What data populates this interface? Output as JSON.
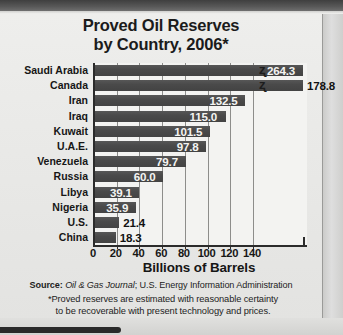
{
  "chart_data": {
    "type": "bar",
    "orientation": "horizontal",
    "title_line1": "Proved Oil Reserves",
    "title_line2": "by Country, 2006*",
    "categories": [
      "Saudi Arabia",
      "Canada",
      "Iran",
      "Iraq",
      "Kuwait",
      "U.A.E.",
      "Venezuela",
      "Russia",
      "Libya",
      "Nigeria",
      "U.S.",
      "China"
    ],
    "values": [
      264.3,
      178.8,
      132.5,
      115.0,
      101.5,
      97.8,
      79.7,
      60.0,
      39.1,
      35.9,
      21.4,
      18.3
    ],
    "value_labels": [
      "264.3",
      "178.8",
      "132.5",
      "115.0",
      "101.5",
      "97.8",
      "79.7",
      "60.0",
      "39.1",
      "35.9",
      "21.4",
      "18.3"
    ],
    "label_placement": [
      "inside",
      "outside",
      "inside",
      "inside",
      "inside",
      "inside",
      "inside",
      "inside",
      "inside",
      "inside",
      "outside",
      "outside"
    ],
    "axis_break": [
      true,
      true,
      false,
      false,
      false,
      false,
      false,
      false,
      false,
      false,
      false,
      false
    ],
    "xlabel": "Billions of Barrels",
    "ylabel": "",
    "xticks": [
      0,
      20,
      40,
      60,
      80,
      100,
      120,
      140
    ],
    "xtick_labels": [
      "0",
      "20",
      "40",
      "60",
      "80",
      "100",
      "120",
      "140"
    ],
    "xlim": [
      0,
      140
    ],
    "grid": "vertical",
    "legend": "none",
    "bar_color": "#4a4a4a",
    "plot_background": "#f3f3f1",
    "axis_color": "#2b2b2b"
  },
  "notes": {
    "source_label": "Source:",
    "source_italic": "Oil & Gas Journal",
    "source_rest": "; U.S. Energy Information Administration",
    "footnote_line1": "*Proved reserves are estimated with reasonable certainty",
    "footnote_line2": "to be recoverable with present technology and prices."
  }
}
